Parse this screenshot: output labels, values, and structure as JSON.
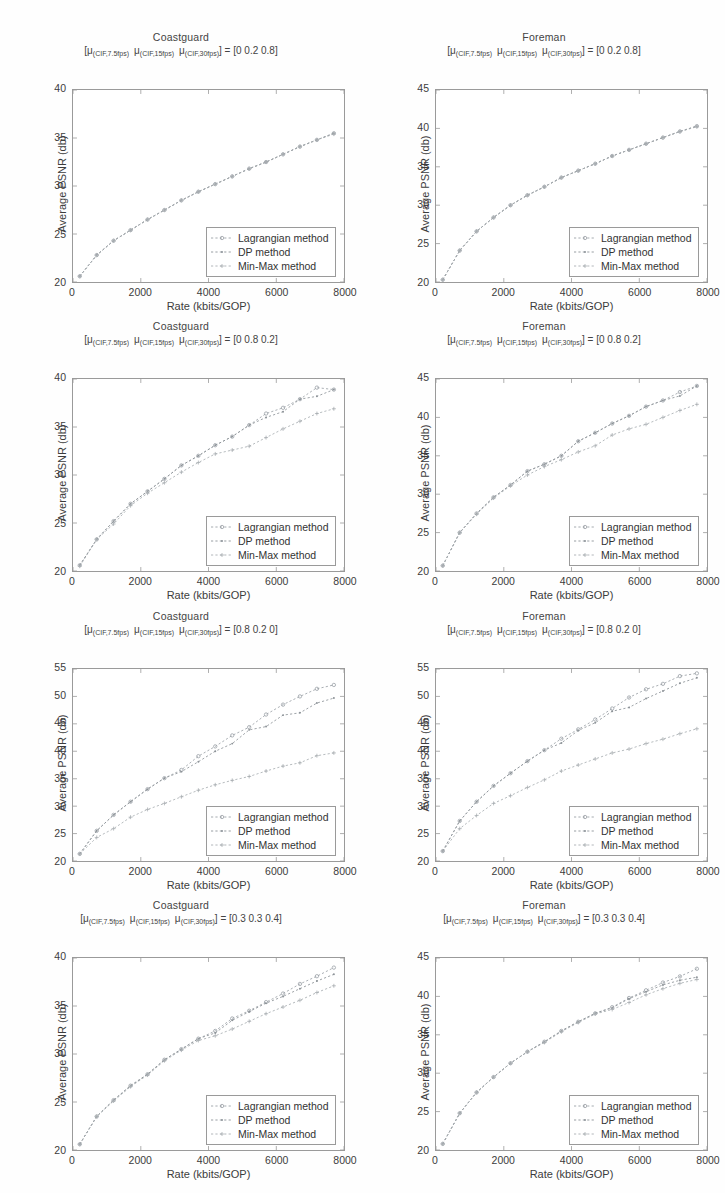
{
  "figure": {
    "background": "#fefefe",
    "axis_color": "#9a9a9a",
    "series_colors": [
      "#9aa0a6",
      "#8d9398",
      "#a9aeb2"
    ],
    "xlabel": "Rate (kbits/GOP)",
    "ylabel": "Average PSNR (db)",
    "legend_labels": [
      "Lagrangian method",
      "DP method",
      "Min-Max method"
    ],
    "subtitle_prefix": "[",
    "subtitle_mu": "μ",
    "subtitle_sub1": "(CIF,7.5fps)",
    "subtitle_sub2": "(CIF,15fps)",
    "subtitle_sub3": "(CIF,30fps)",
    "subtitle_eq": "] = "
  },
  "chart_data": [
    {
      "type": "line",
      "panel_index": 0,
      "title": "Coastguard",
      "weights": "[0  0.2  0.8]",
      "xlabel": "Rate (kbits/GOP)",
      "ylabel": "Average PSNR (db)",
      "xlim": [
        0,
        8000
      ],
      "ylim": [
        20,
        40
      ],
      "xticks": [
        0,
        2000,
        4000,
        6000,
        8000
      ],
      "yticks": [
        20,
        25,
        30,
        35,
        40
      ],
      "grid": false,
      "legend_position": "lower-right",
      "x": [
        200,
        700,
        1200,
        1700,
        2200,
        2700,
        3200,
        3700,
        4200,
        4700,
        5200,
        5700,
        6200,
        6700,
        7200,
        7700
      ],
      "series": [
        {
          "name": "Lagrangian method",
          "values": [
            20.6,
            22.8,
            24.3,
            25.4,
            26.5,
            27.5,
            28.5,
            29.4,
            30.2,
            31.0,
            31.8,
            32.5,
            33.3,
            34.1,
            34.8,
            35.5
          ]
        },
        {
          "name": "DP method",
          "values": [
            20.6,
            22.8,
            24.3,
            25.4,
            26.5,
            27.5,
            28.5,
            29.4,
            30.2,
            31.0,
            31.8,
            32.5,
            33.3,
            34.1,
            34.8,
            35.5
          ]
        },
        {
          "name": "Min-Max method",
          "values": [
            20.6,
            22.8,
            24.3,
            25.4,
            26.5,
            27.5,
            28.5,
            29.4,
            30.2,
            31.0,
            31.8,
            32.5,
            33.3,
            34.1,
            34.8,
            35.4
          ]
        }
      ]
    },
    {
      "type": "line",
      "panel_index": 1,
      "title": "Foreman",
      "weights": "[0  0.2  0.8]",
      "xlabel": "Rate (kbits/GOP)",
      "ylabel": "Average PSNR (db)",
      "xlim": [
        0,
        8000
      ],
      "ylim": [
        20,
        45
      ],
      "xticks": [
        0,
        2000,
        4000,
        6000,
        8000
      ],
      "yticks": [
        20,
        25,
        30,
        35,
        40,
        45
      ],
      "grid": false,
      "legend_position": "lower-right",
      "x": [
        200,
        700,
        1200,
        1700,
        2200,
        2700,
        3200,
        3700,
        4200,
        4700,
        5200,
        5700,
        6200,
        6700,
        7200,
        7700
      ],
      "series": [
        {
          "name": "Lagrangian method",
          "values": [
            20.3,
            24.1,
            26.6,
            28.4,
            30.0,
            31.3,
            32.4,
            33.6,
            34.5,
            35.4,
            36.4,
            37.2,
            38.0,
            38.8,
            39.6,
            40.3
          ]
        },
        {
          "name": "DP method",
          "values": [
            20.3,
            24.1,
            26.6,
            28.4,
            30.0,
            31.3,
            32.4,
            33.6,
            34.5,
            35.4,
            36.4,
            37.2,
            38.0,
            38.8,
            39.6,
            40.3
          ]
        },
        {
          "name": "Min-Max method",
          "values": [
            20.3,
            24.1,
            26.6,
            28.4,
            30.0,
            31.3,
            32.4,
            33.6,
            34.5,
            35.4,
            36.4,
            37.2,
            38.0,
            38.8,
            39.6,
            40.2
          ]
        }
      ]
    },
    {
      "type": "line",
      "panel_index": 2,
      "title": "Coastguard",
      "weights": "[0  0.8  0.2]",
      "xlabel": "Rate (kbits/GOP)",
      "ylabel": "Average PSNR (db)",
      "xlim": [
        0,
        8000
      ],
      "ylim": [
        20,
        40
      ],
      "xticks": [
        0,
        2000,
        4000,
        6000,
        8000
      ],
      "yticks": [
        20,
        25,
        30,
        35,
        40
      ],
      "grid": false,
      "legend_position": "lower-right",
      "x": [
        200,
        700,
        1200,
        1700,
        2200,
        2700,
        3200,
        3700,
        4200,
        4700,
        5200,
        5700,
        6200,
        6700,
        7200,
        7700
      ],
      "series": [
        {
          "name": "Lagrangian method",
          "values": [
            20.6,
            23.3,
            25.2,
            27.0,
            28.3,
            29.6,
            31.0,
            32.0,
            33.1,
            34.0,
            35.2,
            36.4,
            37.0,
            37.9,
            39.1,
            38.9
          ]
        },
        {
          "name": "DP method",
          "values": [
            20.6,
            23.3,
            25.2,
            27.0,
            28.3,
            29.6,
            31.0,
            32.0,
            33.1,
            34.0,
            35.2,
            36.0,
            36.6,
            37.9,
            38.2,
            38.9
          ]
        },
        {
          "name": "Min-Max method",
          "values": [
            20.5,
            23.3,
            24.9,
            26.8,
            28.1,
            29.2,
            30.3,
            31.3,
            32.2,
            32.6,
            33.0,
            33.9,
            34.8,
            35.6,
            36.4,
            36.9
          ]
        }
      ]
    },
    {
      "type": "line",
      "panel_index": 3,
      "title": "Foreman",
      "weights": "[0  0.8  0.2]",
      "xlabel": "Rate (kbits/GOP)",
      "ylabel": "Average PSNR (db)",
      "xlim": [
        0,
        8000
      ],
      "ylim": [
        20,
        45
      ],
      "xticks": [
        0,
        2000,
        4000,
        6000,
        8000
      ],
      "yticks": [
        20,
        25,
        30,
        35,
        40,
        45
      ],
      "grid": false,
      "legend_position": "lower-right",
      "x": [
        200,
        700,
        1200,
        1700,
        2200,
        2700,
        3200,
        3700,
        4200,
        4700,
        5200,
        5700,
        6200,
        6700,
        7200,
        7700
      ],
      "series": [
        {
          "name": "Lagrangian method",
          "values": [
            20.7,
            25.0,
            27.5,
            29.6,
            31.2,
            33.0,
            33.9,
            35.0,
            36.9,
            38.0,
            39.2,
            40.2,
            41.4,
            42.2,
            43.3,
            44.1
          ]
        },
        {
          "name": "DP method",
          "values": [
            20.7,
            25.0,
            27.5,
            29.6,
            31.2,
            33.0,
            33.9,
            35.0,
            36.9,
            38.0,
            39.2,
            40.2,
            41.4,
            42.2,
            42.8,
            44.1
          ]
        },
        {
          "name": "Min-Max method",
          "values": [
            20.7,
            25.0,
            27.4,
            29.5,
            31.1,
            32.5,
            33.6,
            34.5,
            35.5,
            36.3,
            37.7,
            38.5,
            39.1,
            40.0,
            40.9,
            41.7
          ]
        }
      ]
    },
    {
      "type": "line",
      "panel_index": 4,
      "title": "Coastguard",
      "weights": "[0.8  0.2  0]",
      "xlabel": "Rate (kbits/GOP)",
      "ylabel": "Average PSNR (db)",
      "xlim": [
        0,
        8000
      ],
      "ylim": [
        20,
        55
      ],
      "xticks": [
        0,
        2000,
        4000,
        6000,
        8000
      ],
      "yticks": [
        20,
        25,
        30,
        35,
        40,
        45,
        50,
        55
      ],
      "grid": false,
      "legend_position": "lower-right",
      "x": [
        200,
        700,
        1200,
        1700,
        2200,
        2700,
        3200,
        3700,
        4200,
        4700,
        5200,
        5700,
        6200,
        6700,
        7200,
        7700
      ],
      "series": [
        {
          "name": "Lagrangian method",
          "values": [
            21.3,
            25.5,
            28.4,
            30.8,
            33.1,
            35.1,
            36.6,
            39.1,
            40.9,
            42.9,
            44.4,
            46.7,
            48.5,
            50.0,
            51.4,
            52.1
          ]
        },
        {
          "name": "DP method",
          "values": [
            21.3,
            25.5,
            28.4,
            30.8,
            33.1,
            35.1,
            36.3,
            38.1,
            40.0,
            41.4,
            43.9,
            44.5,
            46.6,
            47.0,
            48.8,
            49.7
          ]
        },
        {
          "name": "Min-Max method",
          "values": [
            21.3,
            24.3,
            25.9,
            28.0,
            29.4,
            30.5,
            31.7,
            32.9,
            33.9,
            34.7,
            35.4,
            36.4,
            37.3,
            37.9,
            39.2,
            39.7
          ]
        }
      ]
    },
    {
      "type": "line",
      "panel_index": 5,
      "title": "Foreman",
      "weights": "[0.8  0.2  0]",
      "xlabel": "Rate (kbits/GOP)",
      "ylabel": "Average PSNR (db)",
      "xlim": [
        0,
        8000
      ],
      "ylim": [
        20,
        55
      ],
      "xticks": [
        0,
        2000,
        4000,
        6000,
        8000
      ],
      "yticks": [
        20,
        25,
        30,
        35,
        40,
        45,
        50,
        55
      ],
      "grid": false,
      "legend_position": "lower-right",
      "x": [
        200,
        700,
        1200,
        1700,
        2200,
        2700,
        3200,
        3700,
        4200,
        4700,
        5200,
        5700,
        6200,
        6700,
        7200,
        7700
      ],
      "series": [
        {
          "name": "Lagrangian method",
          "values": [
            21.8,
            27.3,
            30.8,
            33.7,
            36.0,
            38.2,
            40.2,
            42.3,
            44.0,
            45.8,
            47.8,
            49.8,
            51.3,
            52.3,
            53.7,
            54.2
          ]
        },
        {
          "name": "DP method",
          "values": [
            21.8,
            27.3,
            30.8,
            33.7,
            36.0,
            38.2,
            40.2,
            41.5,
            43.8,
            45.2,
            47.3,
            48.0,
            49.6,
            51.0,
            52.4,
            53.4
          ]
        },
        {
          "name": "Min-Max method",
          "values": [
            21.8,
            25.9,
            28.3,
            30.5,
            31.9,
            33.4,
            34.8,
            36.4,
            37.5,
            38.6,
            39.7,
            40.4,
            41.4,
            42.2,
            43.2,
            44.1
          ]
        }
      ]
    },
    {
      "type": "line",
      "panel_index": 6,
      "title": "Coastguard",
      "weights": "[0.3  0.3  0.4]",
      "xlabel": "Rate (kbits/GOP)",
      "ylabel": "Average PSNR (db)",
      "xlim": [
        0,
        8000
      ],
      "ylim": [
        20,
        40
      ],
      "xticks": [
        0,
        2000,
        4000,
        6000,
        8000
      ],
      "yticks": [
        20,
        25,
        30,
        35,
        40
      ],
      "grid": false,
      "legend_position": "lower-right",
      "x": [
        200,
        700,
        1200,
        1700,
        2200,
        2700,
        3200,
        3700,
        4200,
        4700,
        5200,
        5700,
        6200,
        6700,
        7200,
        7700
      ],
      "series": [
        {
          "name": "Lagrangian method",
          "values": [
            20.6,
            23.5,
            25.2,
            26.7,
            27.9,
            29.4,
            30.5,
            31.6,
            32.4,
            33.7,
            34.5,
            35.4,
            36.3,
            37.3,
            38.1,
            39.0
          ]
        },
        {
          "name": "DP method",
          "values": [
            20.6,
            23.5,
            25.2,
            26.7,
            27.9,
            29.4,
            30.5,
            31.6,
            32.2,
            33.5,
            34.4,
            35.3,
            36.0,
            36.8,
            37.6,
            38.3
          ]
        },
        {
          "name": "Min-Max method",
          "values": [
            20.6,
            23.5,
            25.1,
            26.6,
            27.8,
            29.3,
            30.4,
            31.4,
            31.9,
            32.6,
            33.4,
            34.2,
            34.9,
            35.6,
            36.4,
            37.1
          ]
        }
      ]
    },
    {
      "type": "line",
      "panel_index": 7,
      "title": "Foreman",
      "weights": "[0.3  0.3  0.4]",
      "xlabel": "Rate (kbits/GOP)",
      "ylabel": "Average PSNR (db)",
      "xlim": [
        0,
        8000
      ],
      "ylim": [
        20,
        45
      ],
      "xticks": [
        0,
        2000,
        4000,
        6000,
        8000
      ],
      "yticks": [
        20,
        25,
        30,
        35,
        40,
        45
      ],
      "grid": false,
      "legend_position": "lower-right",
      "x": [
        200,
        700,
        1200,
        1700,
        2200,
        2700,
        3200,
        3700,
        4200,
        4700,
        5200,
        5700,
        6200,
        6700,
        7200,
        7700
      ],
      "series": [
        {
          "name": "Lagrangian method",
          "values": [
            20.8,
            24.8,
            27.5,
            29.5,
            31.3,
            32.8,
            34.1,
            35.5,
            36.7,
            37.8,
            38.6,
            39.8,
            40.8,
            41.8,
            42.6,
            43.6
          ]
        },
        {
          "name": "DP method",
          "values": [
            20.8,
            24.8,
            27.5,
            29.5,
            31.3,
            32.8,
            34.1,
            35.5,
            36.7,
            37.8,
            38.5,
            39.7,
            40.6,
            41.5,
            42.1,
            42.5
          ]
        },
        {
          "name": "Min-Max method",
          "values": [
            20.8,
            24.8,
            27.5,
            29.5,
            31.3,
            32.8,
            34.0,
            35.4,
            36.6,
            37.7,
            38.3,
            39.2,
            40.2,
            41.0,
            41.7,
            42.2
          ]
        }
      ]
    }
  ]
}
